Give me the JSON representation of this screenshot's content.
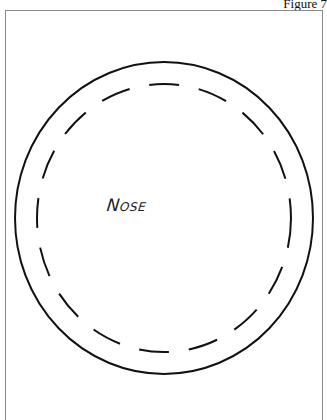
{
  "figure": {
    "label": "Figure 7",
    "diagram_label": "Nose",
    "shapes": {
      "outer_circle": {
        "style": "solid",
        "cx": 164,
        "cy": 218,
        "rx": 149,
        "ry": 156,
        "color": "#111111"
      },
      "inner_circle": {
        "style": "dashed",
        "cx": 164,
        "cy": 218,
        "rx": 127,
        "ry": 134,
        "color": "#111111"
      }
    }
  }
}
